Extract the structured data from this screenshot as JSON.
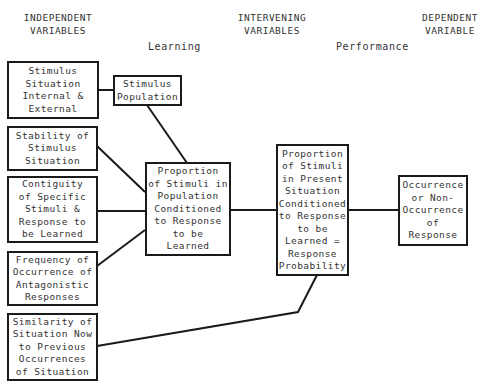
{
  "headers": {
    "independent": "INDEPENDENT\nVARIABLES",
    "intervening": "INTERVENING\nVARIABLES",
    "dependent": "DEPENDENT\nVARIABLE"
  },
  "subheaders": {
    "learning": "Learning",
    "performance": "Performance"
  },
  "nodes": {
    "stimulus_situation": "Stimulus\nSituation\nInternal &\nExternal",
    "stimulus_population": "Stimulus\nPopulation",
    "stability": "Stability of\nStimulus\nSituation",
    "contiguity": "Contiguity\nof Specific\nStimuli &\nResponse to\nbe Learned",
    "frequency": "Frequency of\nOccurrence of\nAntagonistic\nResponses",
    "similarity": "Similarity of\nSituation Now\nto Previous\nOccurrences\nof Situation",
    "proportion_population": "Proportion\nof Stimuli in\nPopulation\nConditioned\nto Response\nto be\nLearned",
    "proportion_present": "Proportion\nof Stimuli\nin Present\nSituation\nConditioned\nto Response\nto be\nLearned =\nResponse\nProbability",
    "occurrence": "Occurrence\nor Non-\nOccurrence\nof\nResponse"
  },
  "edges": [
    {
      "from": "stimulus_situation",
      "to": "stimulus_population"
    },
    {
      "from": "stimulus_population",
      "to": "proportion_population"
    },
    {
      "from": "stability",
      "to": "proportion_population"
    },
    {
      "from": "contiguity",
      "to": "proportion_population"
    },
    {
      "from": "frequency",
      "to": "proportion_population"
    },
    {
      "from": "proportion_population",
      "to": "proportion_present"
    },
    {
      "from": "similarity",
      "to": "proportion_present"
    },
    {
      "from": "proportion_present",
      "to": "occurrence"
    }
  ]
}
